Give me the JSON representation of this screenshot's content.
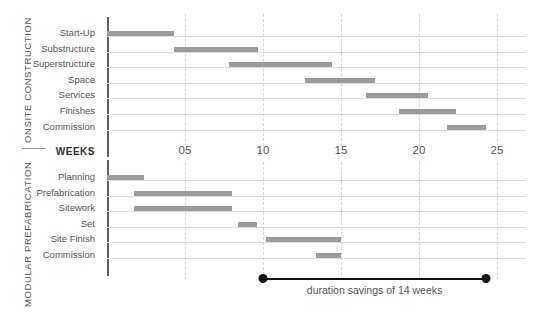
{
  "chart_data": {
    "type": "bar",
    "title": "",
    "xlabel": "WEEKS",
    "ylabel": "",
    "xlim": [
      0,
      26.5
    ],
    "grid": true,
    "legend": false,
    "orientation": "horizontal-gantt",
    "axis": {
      "label": "WEEKS",
      "ticks": [
        5,
        10,
        15,
        20,
        25
      ],
      "tick_labels": [
        "05",
        "10",
        "15",
        "20",
        "25"
      ],
      "unit": "weeks",
      "min": 0,
      "max": 26.5
    },
    "groups": [
      {
        "name": "ONSITE CONSTRUCTION",
        "categories": [
          "Start-Up",
          "Substructure",
          "Superstructure",
          "Space",
          "Services",
          "Finishes",
          "Commission"
        ],
        "tasks": [
          {
            "label": "Start-Up",
            "start": 0.0,
            "end": 4.3,
            "duration": 4.3
          },
          {
            "label": "Substructure",
            "start": 4.3,
            "end": 9.7,
            "duration": 5.4
          },
          {
            "label": "Superstructure",
            "start": 7.8,
            "end": 14.4,
            "duration": 6.6
          },
          {
            "label": "Space",
            "start": 12.7,
            "end": 17.2,
            "duration": 4.5
          },
          {
            "label": "Services",
            "start": 16.6,
            "end": 20.6,
            "duration": 4.0
          },
          {
            "label": "Finishes",
            "start": 18.7,
            "end": 22.4,
            "duration": 3.7
          },
          {
            "label": "Commission",
            "start": 21.8,
            "end": 24.3,
            "duration": 2.5
          }
        ],
        "total_duration": 24.3
      },
      {
        "name": "MODULAR PREFABRICATION",
        "categories": [
          "Planning",
          "Prefabrication",
          "Sitework",
          "Set",
          "Site Finish",
          "Commission"
        ],
        "tasks": [
          {
            "label": "Planning",
            "start": 0.0,
            "end": 2.4,
            "duration": 2.4
          },
          {
            "label": "Prefabrication",
            "start": 1.7,
            "end": 8.0,
            "duration": 6.3
          },
          {
            "label": "Sitework",
            "start": 1.7,
            "end": 8.0,
            "duration": 6.3
          },
          {
            "label": "Set",
            "start": 8.4,
            "end": 9.6,
            "duration": 1.2
          },
          {
            "label": "Site Finish",
            "start": 10.2,
            "end": 15.0,
            "duration": 4.8
          },
          {
            "label": "Commission",
            "start": 13.4,
            "end": 15.0,
            "duration": 1.6
          }
        ],
        "total_duration": 15.0
      }
    ],
    "annotation": {
      "text": "duration savings of 14 weeks",
      "start": 10.0,
      "end": 24.3,
      "value": 14,
      "unit": "weeks"
    },
    "colors": {
      "bar": "#9b9b9b",
      "axis": "#5d5d5d",
      "rowline": "#dedede",
      "gridline": "#d6d6d6",
      "annotation": "#111111",
      "text": "#555555"
    }
  },
  "groups": {
    "onsite": {
      "name": "ONSITE CONSTRUCTION"
    },
    "modular": {
      "name": "MODULAR PREFABRICATION"
    }
  },
  "weeks_axis": {
    "label": "WEEKS",
    "tick_labels": [
      "05",
      "10",
      "15",
      "20",
      "25"
    ]
  },
  "savings": {
    "text": "duration savings of 14 weeks"
  }
}
